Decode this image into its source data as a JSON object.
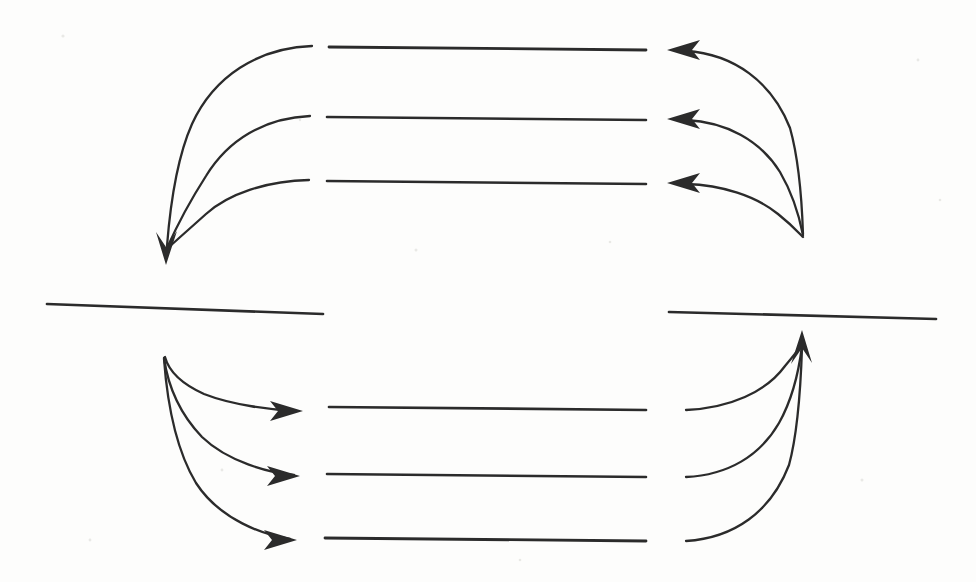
{
  "figure": {
    "canvas": {
      "width": 976,
      "height": 582
    },
    "colors": {
      "background": "#fdfdfc",
      "stroke": "#2b2b2b",
      "speck": "#e9e9e6"
    },
    "stroke_widths": {
      "horizontal_line": 2.6,
      "curve": 2.2,
      "separator": 2.6
    }
  },
  "chart_data": {
    "type": "line",
    "xlabel": "",
    "ylabel": "",
    "xlim": [
      0,
      976
    ],
    "ylim": [
      0,
      582
    ],
    "grid": false,
    "legend": "none",
    "annotations": [
      "downward arrowhead at left of upper group",
      "three leftward arrowheads at right of upper group",
      "three rightward arrowheads at left of lower group",
      "upward arrowhead at right of lower group"
    ],
    "groups": [
      {
        "name": "upper-group",
        "straight_segments": [
          {
            "id": "upper-line-1",
            "x1": 329,
            "y1": 47,
            "x2": 646,
            "y2": 50
          },
          {
            "id": "upper-line-2",
            "x1": 327,
            "y1": 117,
            "x2": 646,
            "y2": 120
          },
          {
            "id": "upper-line-3",
            "x1": 327,
            "y1": 181,
            "x2": 646,
            "y2": 184
          }
        ],
        "left_convergence": {
          "x": 166,
          "y": 258
        },
        "right_convergence": {
          "x": 803,
          "y": 236
        }
      },
      {
        "name": "lower-group",
        "straight_segments": [
          {
            "id": "lower-line-1",
            "x1": 329,
            "y1": 407,
            "x2": 646,
            "y2": 410
          },
          {
            "id": "lower-line-2",
            "x1": 327,
            "y1": 474,
            "x2": 646,
            "y2": 477
          },
          {
            "id": "lower-line-3",
            "x1": 325,
            "y1": 538,
            "x2": 646,
            "y2": 541
          }
        ],
        "left_convergence": {
          "x": 165,
          "y": 357
        },
        "right_convergence": {
          "x": 802,
          "y": 337
        }
      }
    ],
    "separators": [
      {
        "id": "separator-left",
        "x1": 47,
        "y1": 304,
        "x2": 323,
        "y2": 314
      },
      {
        "id": "separator-right",
        "x1": 669,
        "y1": 312,
        "x2": 936,
        "y2": 319
      }
    ],
    "arrowheads": [
      {
        "id": "upper-left-down-arrow",
        "x": 166,
        "y": 258,
        "direction": "down"
      },
      {
        "id": "upper-right-arrow-1",
        "x": 667,
        "y": 50,
        "direction": "left"
      },
      {
        "id": "upper-right-arrow-2",
        "x": 667,
        "y": 119,
        "direction": "left"
      },
      {
        "id": "upper-right-arrow-3",
        "x": 667,
        "y": 183,
        "direction": "left"
      },
      {
        "id": "lower-left-arrow-1",
        "x": 303,
        "y": 411,
        "direction": "right"
      },
      {
        "id": "lower-left-arrow-2",
        "x": 300,
        "y": 476,
        "direction": "right"
      },
      {
        "id": "lower-left-arrow-3",
        "x": 297,
        "y": 540,
        "direction": "right"
      },
      {
        "id": "lower-right-up-arrow",
        "x": 802,
        "y": 337,
        "direction": "up"
      }
    ]
  }
}
